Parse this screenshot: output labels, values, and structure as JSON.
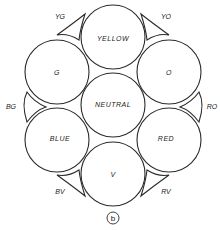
{
  "diagram": {
    "circles": [
      {
        "id": "yellow",
        "label": "YELLOW"
      },
      {
        "id": "o",
        "label": "O"
      },
      {
        "id": "red",
        "label": "RED"
      },
      {
        "id": "v",
        "label": "V"
      },
      {
        "id": "blue",
        "label": "BLUE"
      },
      {
        "id": "g",
        "label": "G"
      },
      {
        "id": "neutral",
        "label": "NEUTRAL"
      }
    ],
    "wedges": [
      {
        "id": "yg",
        "label": "YG"
      },
      {
        "id": "yo",
        "label": "YO"
      },
      {
        "id": "ro",
        "label": "RO"
      },
      {
        "id": "rv",
        "label": "RV"
      },
      {
        "id": "bv",
        "label": "BV"
      },
      {
        "id": "bg",
        "label": "BG"
      }
    ],
    "figure_marker": "b",
    "line_color": "#2a2a2a",
    "background": "#ffffff"
  }
}
